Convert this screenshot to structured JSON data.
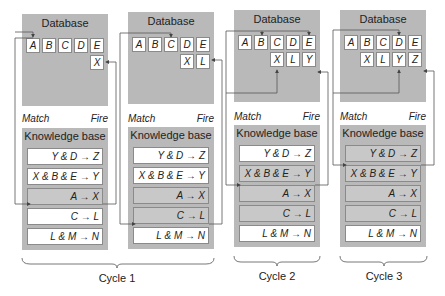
{
  "labels": {
    "database": "Database",
    "match": "Match",
    "fire": "Fire",
    "knowledge_base": "Knowledge base"
  },
  "cycles": [
    {
      "label": "Cycle 1"
    },
    {
      "label": "Cycle 2"
    },
    {
      "label": "Cycle 3"
    }
  ],
  "panels": [
    {
      "db_row1": [
        "A",
        "B",
        "C",
        "D",
        "E"
      ],
      "db_row2": [
        "X"
      ],
      "rules": [
        {
          "text": "Y & D → Z",
          "state": "unused"
        },
        {
          "text": "X & B & E → Y",
          "state": "unused"
        },
        {
          "text": "A → X",
          "state": "fired"
        },
        {
          "text": "C → L",
          "state": "unused"
        },
        {
          "text": "L & M → N",
          "state": "unused"
        }
      ]
    },
    {
      "db_row1": [
        "A",
        "B",
        "C",
        "D",
        "E"
      ],
      "db_row2": [
        "X",
        "L"
      ],
      "rules": [
        {
          "text": "Y & D → Z",
          "state": "unused"
        },
        {
          "text": "X & B & E → Y",
          "state": "unused"
        },
        {
          "text": "A → X",
          "state": "used"
        },
        {
          "text": "C → L",
          "state": "fired"
        },
        {
          "text": "L & M → N",
          "state": "unused"
        }
      ]
    },
    {
      "db_row1": [
        "A",
        "B",
        "C",
        "D",
        "E"
      ],
      "db_row2": [
        "X",
        "L",
        "Y"
      ],
      "rules": [
        {
          "text": "Y & D → Z",
          "state": "unused"
        },
        {
          "text": "X & B & E → Y",
          "state": "fired"
        },
        {
          "text": "A → X",
          "state": "used"
        },
        {
          "text": "C → L",
          "state": "used"
        },
        {
          "text": "L & M → N",
          "state": "unused"
        }
      ]
    },
    {
      "db_row1": [
        "A",
        "B",
        "C",
        "D",
        "E"
      ],
      "db_row2": [
        "X",
        "L",
        "Y",
        "Z"
      ],
      "rules": [
        {
          "text": "Y & D → Z",
          "state": "fired"
        },
        {
          "text": "X & B & E → Y",
          "state": "used"
        },
        {
          "text": "A → X",
          "state": "used"
        },
        {
          "text": "C → L",
          "state": "used"
        },
        {
          "text": "L & M → N",
          "state": "unused"
        }
      ]
    }
  ],
  "colors": {
    "panel_bg": "#b9b9b9",
    "cell_bg": "#ffffff",
    "used_rule_bg": "#c8c8c8",
    "line": "#555555"
  }
}
